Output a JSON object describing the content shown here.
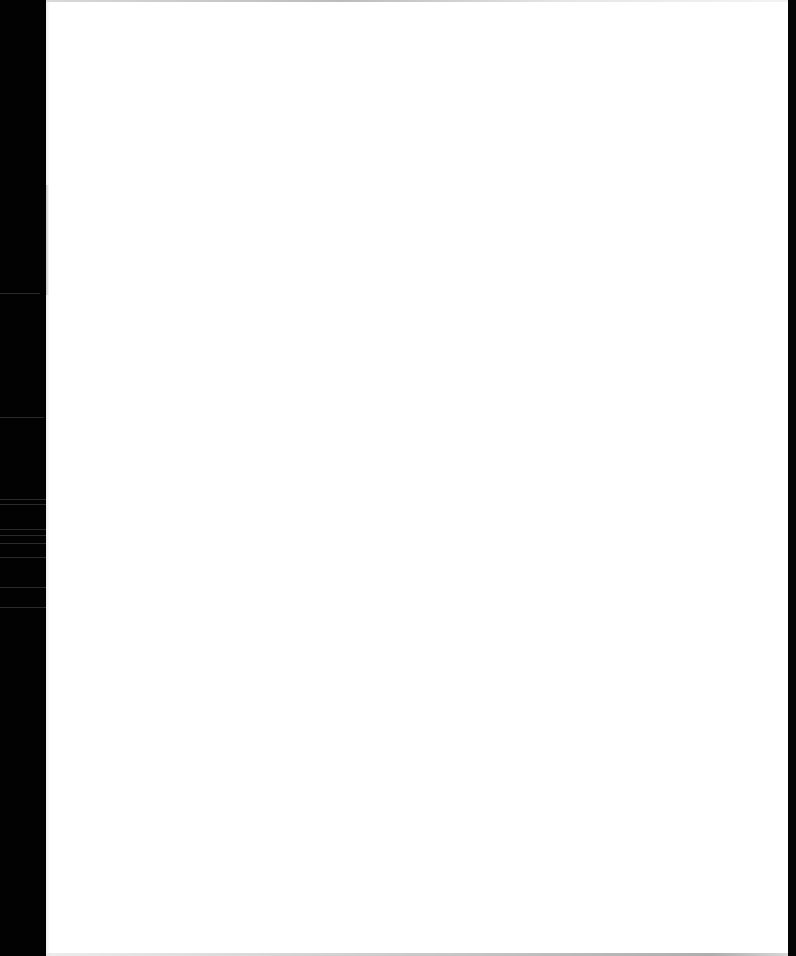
{
  "document": {
    "type": "scanned-page",
    "content": "",
    "colors": {
      "page": "#ffffff",
      "scanner_background": "#000000"
    }
  }
}
